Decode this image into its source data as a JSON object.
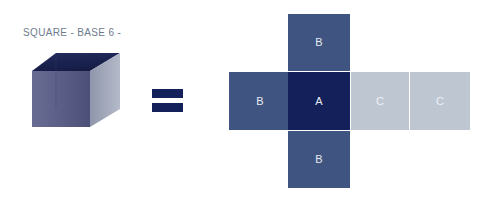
{
  "title": "SQUARE - BASE 6 -",
  "colors": {
    "background": "#ffffff",
    "title_text": "#6e7b8c",
    "face_a": "#14205a",
    "face_b": "#3f5480",
    "face_c": "#bec6d2",
    "equals": "#14205a",
    "cube_top": "#1b2452",
    "cube_front": "#5a5d86",
    "cube_right": "#a7adbe",
    "face_label_text": "#e8ecf3"
  },
  "equation": {
    "operator": "=",
    "operator_name": "equals-sign"
  },
  "solid": {
    "name": "cube",
    "label": "SQUARE - BASE 6 -",
    "faces_visible": 3
  },
  "net": {
    "layout": "cross",
    "face_count": 6,
    "faces": [
      {
        "id": "b-top",
        "label": "B",
        "color": "#3f5480",
        "position": "top"
      },
      {
        "id": "b-left",
        "label": "B",
        "color": "#3f5480",
        "position": "left"
      },
      {
        "id": "a-center",
        "label": "A",
        "color": "#14205a",
        "position": "center"
      },
      {
        "id": "c-1",
        "label": "C",
        "color": "#bec6d2",
        "position": "right-inner"
      },
      {
        "id": "c-2",
        "label": "C",
        "color": "#bec6d2",
        "position": "right-outer"
      },
      {
        "id": "b-bottom",
        "label": "B",
        "color": "#3f5480",
        "position": "bottom"
      }
    ]
  }
}
